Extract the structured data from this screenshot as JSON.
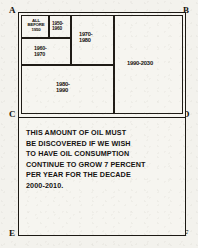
{
  "diagram": {
    "title_caption": [
      "THIS AMOUNT OF OIL MUST",
      "BE DISCOVERED IF WE WISH",
      "TO HAVE OIL CONSUMPTION",
      "CONTINUE TO GROW 7 PERCENT",
      "PER YEAR FOR THE DECADE",
      "2000-2010."
    ],
    "corner_labels": {
      "top_left": "A",
      "top_right": "B",
      "middle_left": "C",
      "middle_right": "D",
      "bottom_left": "E",
      "bottom_right": "F"
    },
    "blocks": [
      {
        "id": "all-before-1950",
        "label": "ALL\nBEFORE\n1950"
      },
      {
        "id": "1950-1960",
        "label": "1950-\n1960"
      },
      {
        "id": "1960-1970",
        "label": "1960-\n1970"
      },
      {
        "id": "1970-1980",
        "label": "1970-\n1980"
      },
      {
        "id": "1980-1990",
        "label": "1980-\n1990"
      },
      {
        "id": "1990-2030",
        "label": "1990-2030"
      }
    ],
    "colors": {
      "ink": "#1b1814",
      "paper": "#f3f2ed"
    }
  }
}
